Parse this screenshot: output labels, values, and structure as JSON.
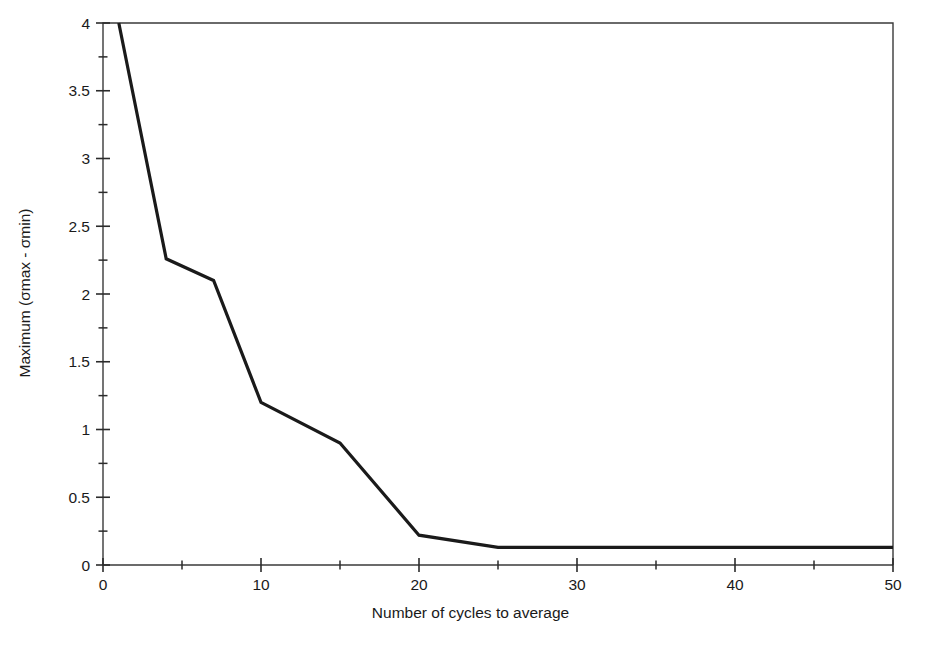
{
  "chart_data": {
    "type": "line",
    "title": "",
    "xlabel": "Number of cycles to average",
    "ylabel": "Maximum (σmax - σmin)",
    "xlim": [
      0,
      50
    ],
    "ylim": [
      0,
      4
    ],
    "grid": false,
    "legend": null,
    "x_major_ticks": [
      0,
      10,
      20,
      30,
      40,
      50
    ],
    "x_major_tick_labels": [
      "0",
      "10",
      "20",
      "30",
      "40",
      "50"
    ],
    "x_minor_ticks": [
      5,
      15,
      25,
      35,
      45
    ],
    "y_major_ticks": [
      0,
      0.5,
      1,
      1.5,
      2,
      2.5,
      3,
      3.5,
      4
    ],
    "y_major_tick_labels": [
      "0",
      "0.5",
      "1",
      "1.5",
      "2",
      "2.5",
      "3",
      "3.5",
      "4"
    ],
    "y_minor_ticks": [
      0.25,
      0.75,
      1.25,
      1.75,
      2.25,
      2.75,
      3.25,
      3.75
    ],
    "series": [
      {
        "name": "Maximum (σmax - σmin)",
        "color": "#1a1a1a",
        "line_width": 3.2,
        "x": [
          1,
          4,
          7,
          10,
          15,
          20,
          25,
          30,
          40,
          50
        ],
        "y": [
          4.0,
          2.26,
          2.1,
          1.2,
          0.9,
          0.22,
          0.13,
          0.13,
          0.13,
          0.13
        ]
      }
    ]
  },
  "plot": {
    "frame_color": "#3a3a3a",
    "frame_width": 1.4,
    "background": "#ffffff",
    "left_px": 103,
    "right_px": 893,
    "top_px": 23,
    "bottom_px": 565
  }
}
